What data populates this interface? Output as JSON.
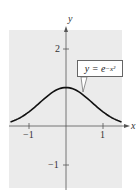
{
  "chart_data": {
    "type": "line",
    "title": "",
    "xlabel": "x",
    "ylabel": "y",
    "xlim": [
      -1.5,
      1.5
    ],
    "ylim": [
      -1.6,
      2.5
    ],
    "x_ticks": [
      -1,
      1
    ],
    "x_tick_labels": [
      "−1",
      "1"
    ],
    "y_ticks": [
      2,
      -1
    ],
    "y_tick_labels": [
      "2",
      "−1"
    ],
    "grid": false,
    "background": "#ebebeb",
    "series": [
      {
        "name": "y = e^(−x²)",
        "x": [
          -1.5,
          -1.25,
          -1.0,
          -0.75,
          -0.5,
          -0.25,
          0,
          0.25,
          0.5,
          0.75,
          1.0,
          1.25,
          1.5
        ],
        "y": [
          0.105,
          0.21,
          0.368,
          0.57,
          0.779,
          0.939,
          1.0,
          0.939,
          0.779,
          0.57,
          0.368,
          0.21,
          0.105
        ],
        "color": "#111111"
      }
    ],
    "annotations": [
      {
        "text": "y = e^(−x²)",
        "points_to": [
          0.45,
          0.82
        ]
      }
    ]
  },
  "labels": {
    "x_axis": "x",
    "y_axis": "y",
    "tick_x_neg1": "−1",
    "tick_x_1": "1",
    "tick_y_2": "2",
    "tick_y_neg1": "−1",
    "equation_main": "y = e",
    "equation_exp": "−x²"
  }
}
